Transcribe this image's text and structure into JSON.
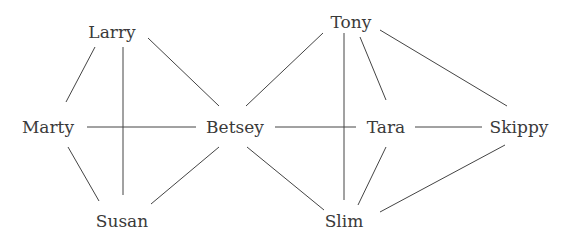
{
  "diagram": {
    "type": "network-graph",
    "colors": {
      "edge": "#444444",
      "label": "#3a3a3a",
      "background": "#ffffff"
    },
    "nodes": [
      {
        "id": "larry",
        "label": "Larry",
        "x": 112,
        "y": 38
      },
      {
        "id": "marty",
        "label": "Marty",
        "x": 48,
        "y": 133
      },
      {
        "id": "betsey",
        "label": "Betsey",
        "x": 235,
        "y": 133
      },
      {
        "id": "susan",
        "label": "Susan",
        "x": 122,
        "y": 227
      },
      {
        "id": "tony",
        "label": "Tony",
        "x": 351,
        "y": 28
      },
      {
        "id": "tara",
        "label": "Tara",
        "x": 386,
        "y": 133
      },
      {
        "id": "skippy",
        "label": "Skippy",
        "x": 519,
        "y": 133
      },
      {
        "id": "slim",
        "label": "Slim",
        "x": 344,
        "y": 227
      }
    ],
    "edges": [
      {
        "from": "larry",
        "to": "marty",
        "x1": 95,
        "y1": 47,
        "x2": 66,
        "y2": 102
      },
      {
        "from": "larry",
        "to": "susan",
        "x1": 123,
        "y1": 47,
        "x2": 123,
        "y2": 195
      },
      {
        "from": "larry",
        "to": "betsey",
        "x1": 148,
        "y1": 38,
        "x2": 219,
        "y2": 106
      },
      {
        "from": "marty",
        "to": "betsey",
        "x1": 87,
        "y1": 127,
        "x2": 196,
        "y2": 127
      },
      {
        "from": "marty",
        "to": "susan",
        "x1": 68,
        "y1": 147,
        "x2": 99,
        "y2": 201
      },
      {
        "from": "betsey",
        "to": "susan",
        "x1": 219,
        "y1": 147,
        "x2": 151,
        "y2": 204
      },
      {
        "from": "betsey",
        "to": "slim",
        "x1": 247,
        "y1": 147,
        "x2": 324,
        "y2": 210
      },
      {
        "from": "betsey",
        "to": "tara",
        "x1": 275,
        "y1": 127,
        "x2": 356,
        "y2": 127
      },
      {
        "from": "betsey",
        "to": "tony",
        "x1": 246,
        "y1": 106,
        "x2": 323,
        "y2": 33
      },
      {
        "from": "tony",
        "to": "slim",
        "x1": 344,
        "y1": 33,
        "x2": 344,
        "y2": 200
      },
      {
        "from": "tony",
        "to": "tara",
        "x1": 360,
        "y1": 37,
        "x2": 386,
        "y2": 100
      },
      {
        "from": "tony",
        "to": "skippy",
        "x1": 380,
        "y1": 30,
        "x2": 507,
        "y2": 106
      },
      {
        "from": "tara",
        "to": "skippy",
        "x1": 415,
        "y1": 127,
        "x2": 482,
        "y2": 127
      },
      {
        "from": "tara",
        "to": "slim",
        "x1": 386,
        "y1": 147,
        "x2": 358,
        "y2": 205
      },
      {
        "from": "skippy",
        "to": "slim",
        "x1": 505,
        "y1": 145,
        "x2": 380,
        "y2": 212
      }
    ]
  }
}
